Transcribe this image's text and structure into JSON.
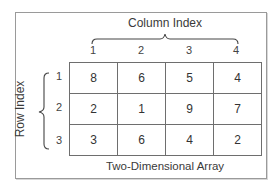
{
  "diagram": {
    "title": "Two-Dimensional Array",
    "column_axis": {
      "title": "Column Index",
      "labels": [
        "1",
        "2",
        "3",
        "4"
      ]
    },
    "row_axis": {
      "title": "Row Index",
      "labels": [
        "1",
        "2",
        "3"
      ]
    },
    "cells": [
      [
        "8",
        "6",
        "5",
        "4"
      ],
      [
        "2",
        "1",
        "9",
        "7"
      ],
      [
        "3",
        "6",
        "4",
        "2"
      ]
    ],
    "colors": {
      "border": "#6e6e6e",
      "frame": "#9a9a9a",
      "text": "#333333"
    }
  }
}
